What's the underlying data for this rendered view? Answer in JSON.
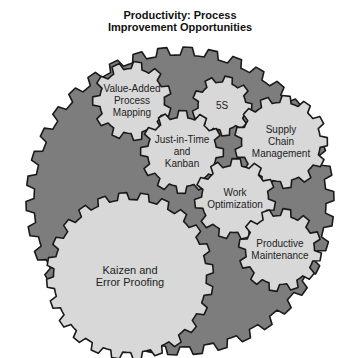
{
  "title": {
    "line1": "Productivity: Process",
    "line2": "Improvement Opportunities"
  },
  "colors": {
    "background_gear": "#7d7d7d",
    "inner_gear": "#d8d8d8",
    "outline": "#1a1a1a",
    "text": "#222222"
  },
  "background_gear": {
    "cx": 180,
    "cy": 201,
    "r": 150,
    "tooth": 8,
    "teeth": 38
  },
  "gears": [
    {
      "id": "value-added-process-mapping",
      "lines": [
        "Value-Added",
        "Process",
        "Mapping"
      ],
      "cx": 132,
      "cy": 101,
      "r": 36,
      "tooth": 7,
      "teeth": 11
    },
    {
      "id": "5s",
      "lines": [
        "5S"
      ],
      "cx": 222,
      "cy": 106,
      "r": 27,
      "tooth": 6,
      "teeth": 9
    },
    {
      "id": "just-in-time-and-kanban",
      "lines": [
        "Just-in-Time",
        "and",
        "Kanban"
      ],
      "cx": 182,
      "cy": 152,
      "r": 38,
      "tooth": 7,
      "teeth": 12
    },
    {
      "id": "supply-chain-management",
      "lines": [
        "Supply",
        "Chain",
        "Management"
      ],
      "cx": 281,
      "cy": 142,
      "r": 43,
      "tooth": 7,
      "teeth": 13
    },
    {
      "id": "work-optimization",
      "lines": [
        "Work",
        "Optimization"
      ],
      "cx": 235,
      "cy": 199,
      "r": 37,
      "tooth": 7,
      "teeth": 11
    },
    {
      "id": "productive-maintenance",
      "lines": [
        "Productive",
        "Maintenance"
      ],
      "cx": 280,
      "cy": 250,
      "r": 38,
      "tooth": 7,
      "teeth": 12
    },
    {
      "id": "kaizen-and-error-proofing",
      "lines": [
        "Kaizen and",
        "Error Proofing"
      ],
      "cx": 130,
      "cy": 276,
      "r": 80,
      "tooth": 7,
      "teeth": 24
    }
  ]
}
